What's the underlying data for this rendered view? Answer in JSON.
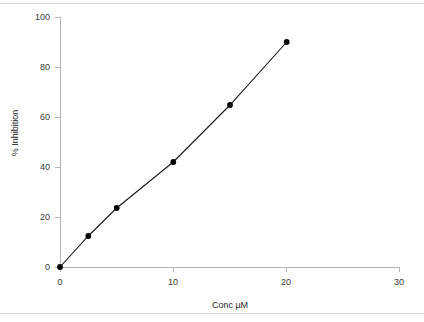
{
  "chart_data": {
    "type": "scatter",
    "title": "",
    "xlabel": "Conc µM",
    "ylabel": "% Inhibition",
    "xlim": [
      0,
      30
    ],
    "ylim": [
      0,
      100
    ],
    "xticks": [
      0,
      10,
      20,
      30
    ],
    "yticks": [
      0,
      20,
      40,
      60,
      80,
      100
    ],
    "xtick_labels": [
      "0",
      "10",
      "20",
      "30"
    ],
    "ytick_labels": [
      "0",
      "20",
      "40",
      "60",
      "80",
      "100"
    ],
    "grid": false,
    "legend": null,
    "series": [
      {
        "name": "% Inhibition",
        "marker": "filled-circle",
        "marker_color": "#000000",
        "line_color": "#1a1a1a",
        "x": [
          0,
          2.5,
          5,
          10,
          15,
          20
        ],
        "values": [
          0,
          12.4,
          23.6,
          42.0,
          64.8,
          90.0
        ]
      }
    ],
    "trendline": {
      "from": [
        0,
        0
      ],
      "to": [
        20,
        88.5
      ],
      "color": "#1a1a1a"
    },
    "axis_color": "#b0b0b0",
    "tick_color": "#b0b0b0",
    "background": "#ffffff"
  },
  "figure": {
    "top_rule": "",
    "bottom_rule": ""
  }
}
